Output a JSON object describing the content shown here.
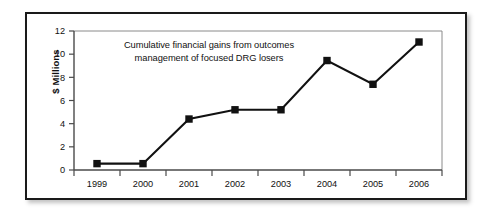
{
  "figure": {
    "background_color": "#ffffff",
    "frame_color": "#1a1a1a"
  },
  "annotation": {
    "line1": "Cumulative financial gains from outcomes",
    "line2": "management of focused DRG losers"
  },
  "axes": {
    "y_title": "$ Millions",
    "y_ticks": [
      "0",
      "2",
      "4",
      "6",
      "8",
      "10",
      "12"
    ],
    "x_ticks": [
      "1999",
      "2000",
      "2001",
      "2002",
      "2003",
      "2004",
      "2005",
      "2006"
    ]
  },
  "chart_data": {
    "type": "line",
    "title": "Cumulative financial gains from outcomes management of focused DRG losers",
    "xlabel": "",
    "ylabel": "$ Millions",
    "categories": [
      "1999",
      "2000",
      "2001",
      "2002",
      "2003",
      "2004",
      "2005",
      "2006"
    ],
    "values": [
      0.55,
      0.55,
      4.4,
      5.2,
      5.2,
      9.45,
      7.4,
      11.05
    ],
    "ylim": [
      0,
      12
    ],
    "ytick_interval": 2,
    "grid": false,
    "legend": false,
    "marker": "square",
    "marker_color": "#111111",
    "line_color": "#111111"
  }
}
